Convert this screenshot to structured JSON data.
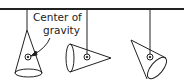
{
  "figure": {
    "title": "",
    "annotation": {
      "line1": "Center of",
      "line2": "gravity"
    },
    "elements": [
      {
        "name": "support-bar",
        "description": "horizontal beam"
      },
      {
        "name": "cone-1",
        "orientation": "apex up, base down",
        "suspension": "hung from apex"
      },
      {
        "name": "cone-2",
        "orientation": "horizontal, apex right",
        "suspension": "hung from center of gravity"
      },
      {
        "name": "cone-3",
        "orientation": "tilted, apex upper-left",
        "suspension": "hung from center of gravity"
      }
    ],
    "colors": {
      "stroke": "#222222",
      "background": "#ffffff"
    }
  }
}
